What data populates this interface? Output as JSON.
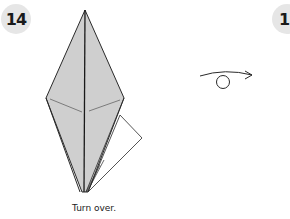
{
  "steps": [
    {
      "number": "14",
      "caption": "Turn over."
    },
    {
      "number": "15"
    }
  ],
  "symbols": {
    "turn_over": "turn-over-arrow"
  },
  "colors": {
    "paper_fill": "#cfcfcf",
    "line": "#2a2a2a",
    "badge_bg": "#e6e6e6"
  }
}
